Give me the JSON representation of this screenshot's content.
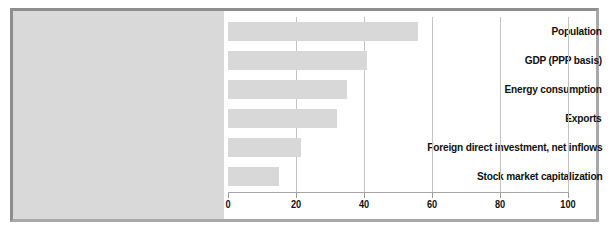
{
  "chart_data": {
    "type": "bar",
    "orientation": "horizontal",
    "title": "",
    "subtitle": "",
    "xlabel": "",
    "ylabel": "",
    "categories": [
      "Population",
      "GDP (PPP basis)",
      "Energy consumption",
      "Exports",
      "Foreign direct investment, net inflows",
      "Stock market capitalization"
    ],
    "values": [
      56,
      41,
      35,
      32,
      21.5,
      15
    ],
    "xlim": [
      0,
      100
    ],
    "xticks": [
      0,
      20,
      40,
      60,
      80,
      100
    ],
    "xtick_labels": [
      "0",
      "20",
      "40",
      "60",
      "80",
      "100"
    ],
    "grid": true,
    "legend": false,
    "legend_position": "none",
    "bar_color": "#d8d8d8",
    "label_panel_color": "#d9d9d9",
    "gridline_color": "#c3c3c3",
    "axis_color": "#a6a6a6",
    "text_color": "#111111",
    "frame_color": "#8f8f8f",
    "background_color": "#ffffff"
  }
}
